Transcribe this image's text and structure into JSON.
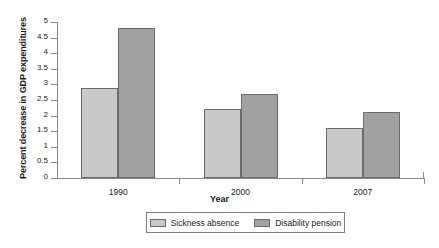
{
  "chart_data": {
    "type": "bar",
    "title": "",
    "xlabel": "Year",
    "ylabel": "Percent decrease in GDP expenditures",
    "categories": [
      "1990",
      "2000",
      "2007"
    ],
    "series": [
      {
        "name": "Sickness absence",
        "color": "#c9c9c9",
        "values": [
          2.9,
          2.2,
          1.6
        ]
      },
      {
        "name": "Disability pension",
        "color": "#a1a1a1",
        "values": [
          4.8,
          2.7,
          2.1
        ]
      }
    ],
    "ylim": [
      0,
      5
    ],
    "ytick_labels": [
      "5",
      "4.5",
      "4",
      "3.5",
      "3",
      "2.5",
      "2",
      "1.5",
      "1",
      "0.5",
      "0"
    ],
    "ytick_values": [
      5,
      4.5,
      4,
      3.5,
      3,
      2.5,
      2,
      1.5,
      1,
      0.5,
      0
    ],
    "grid": false,
    "legend_position": "bottom"
  }
}
